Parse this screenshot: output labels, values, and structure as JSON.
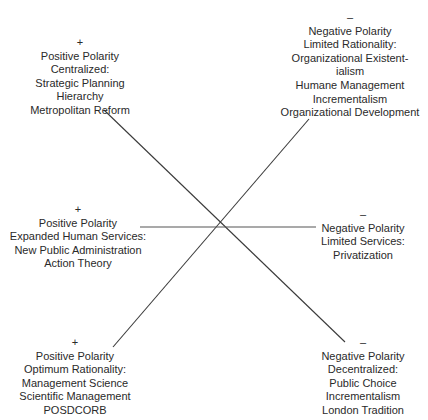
{
  "diagram": {
    "line_color": "#3a3a3a",
    "labels": {
      "top_left": {
        "sign": "+",
        "lines": [
          "Positive Polarity",
          "Centralized:",
          "Strategic Planning",
          "Hierarchy",
          "Metropolitan Reform"
        ]
      },
      "top_right": {
        "sign": "–",
        "lines": [
          "Negative Polarity",
          "Limited Rationality:",
          "Organizational Existent-",
          "ialism",
          "Humane Management",
          "Incrementalism",
          "Organizational Development"
        ]
      },
      "middle_left": {
        "sign": "+",
        "lines": [
          "Positive Polarity",
          "Expanded Human Services:",
          "New Public Administration",
          "Action Theory"
        ]
      },
      "middle_right": {
        "sign": "–",
        "lines": [
          "Negative Polarity",
          "Limited Services:",
          "Privatization"
        ]
      },
      "bottom_left": {
        "sign": "+",
        "lines": [
          "Positive Polarity",
          "Optimum Rationality:",
          "Management Science",
          "Scientific Management",
          "POSDCORB"
        ]
      },
      "bottom_right": {
        "sign": "–",
        "lines": [
          "Negative Polarity",
          "Decentralized:",
          "Public Choice",
          "Incrementalism",
          "London Tradition"
        ]
      }
    }
  }
}
